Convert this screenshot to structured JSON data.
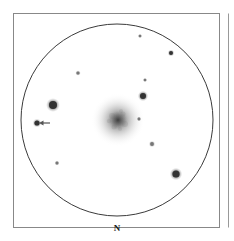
{
  "figure": {
    "background_color": "#ffffff",
    "frame": {
      "name": "outer-panel-border",
      "stroke_color": "#888888",
      "stroke_width": 1,
      "x": 13.5,
      "y": 13.5,
      "width": 206,
      "height": 214
    },
    "adjacent_panel_edge": {
      "name": "adjacent-panel-edge",
      "stroke_color": "#999999",
      "stroke_width": 1,
      "x": 228.5,
      "y_top": 13.5,
      "y_bottom": 227.5
    },
    "field_circle": {
      "name": "eyepiece-field-circle",
      "stroke_color": "#3a3a3a",
      "stroke_width": 1,
      "cx": 117,
      "cy": 120,
      "r": 96
    },
    "compass": {
      "label": "N",
      "x": 117,
      "y": 231,
      "color": "#1a1a1a"
    },
    "nebula": {
      "name": "galaxy-core",
      "cx": 118,
      "cy": 120,
      "outer_r": 27,
      "core_r": 9,
      "color": "#6a6a6a",
      "core_color": "#4a4a4a"
    },
    "marker_arrow": {
      "name": "target-arrow",
      "x_tail": 50,
      "x_head": 39,
      "y": 123,
      "color": "#555555",
      "stroke_width": 1.2
    },
    "stars": [
      {
        "id": "star-1",
        "cx": 140,
        "cy": 36,
        "r": 1.3,
        "mag": "faint"
      },
      {
        "id": "star-2",
        "cx": 171,
        "cy": 53,
        "r": 2.0,
        "mag": "medium"
      },
      {
        "id": "star-3",
        "cx": 78,
        "cy": 73,
        "r": 1.6,
        "mag": "faint"
      },
      {
        "id": "star-4",
        "cx": 145,
        "cy": 80,
        "r": 1.3,
        "mag": "faint"
      },
      {
        "id": "star-5",
        "cx": 143,
        "cy": 96,
        "r": 3.0,
        "mag": "bright"
      },
      {
        "id": "star-6",
        "cx": 53,
        "cy": 105,
        "r": 4.0,
        "mag": "bright"
      },
      {
        "id": "star-7",
        "cx": 37,
        "cy": 123,
        "r": 2.6,
        "mag": "medium"
      },
      {
        "id": "star-8",
        "cx": 139,
        "cy": 119,
        "r": 1.4,
        "mag": "faint"
      },
      {
        "id": "star-9",
        "cx": 152,
        "cy": 144,
        "r": 1.9,
        "mag": "faint"
      },
      {
        "id": "star-10",
        "cx": 57,
        "cy": 163,
        "r": 1.5,
        "mag": "faint"
      },
      {
        "id": "star-11",
        "cx": 176,
        "cy": 174,
        "r": 3.6,
        "mag": "bright"
      }
    ]
  }
}
